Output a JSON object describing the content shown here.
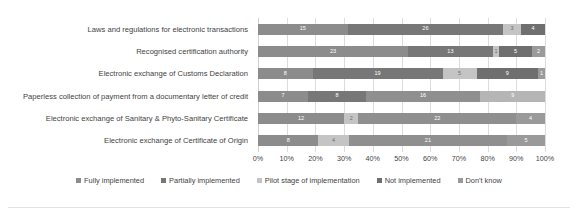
{
  "chart_data": {
    "type": "bar",
    "title": "",
    "subtitle": "",
    "xlabel": "",
    "ylabel": "",
    "orientation": "horizontal",
    "stacked": true,
    "normalized_percent": true,
    "grid": true,
    "legend_position": "bottom",
    "xlim": [
      0,
      100
    ],
    "xticks": [
      "0%",
      "10%",
      "20%",
      "30%",
      "40%",
      "50%",
      "60%",
      "70%",
      "80%",
      "90%",
      "100%"
    ],
    "categories": [
      "Laws and regulations for electronic transactions",
      "Recognised certification authority",
      "Electronic exchange of Customs Declaration",
      "Paperless collection of payment from a documentary letter of credit",
      "Electronic exchange of Sanitary & Phyto-Sanitary Certificate",
      "Electronic exchange of Certificate of Origin"
    ],
    "series": [
      {
        "name": "Fully implemented",
        "color": "#8c8c8c",
        "values": [
          15,
          23,
          8,
          7,
          12,
          8
        ]
      },
      {
        "name": "Partially implemented",
        "color": "#777777",
        "values": [
          26,
          13,
          19,
          8,
          2,
          4
        ]
      },
      {
        "name": "Pilot stage of implementation",
        "color": "#c4c4c4",
        "values": [
          3,
          1,
          5,
          16,
          22,
          21
        ]
      },
      {
        "name": "Not implemented",
        "color": "#6f6f6f",
        "values": [
          4,
          5,
          9,
          9,
          4,
          5
        ]
      },
      {
        "name": "Don't know",
        "color": "#9a9a9a",
        "values": [
          0,
          2,
          1,
          0,
          0,
          0
        ]
      }
    ],
    "bars": [
      {
        "category": "Laws and regulations for electronic transactions",
        "segments": [
          {
            "series": "Fully implemented",
            "value": 15,
            "label": "15",
            "percent": 31.25,
            "color": "#8c8c8c",
            "label_color": "light"
          },
          {
            "series": "Partially implemented",
            "value": 26,
            "label": "26",
            "percent": 54.17,
            "color": "#777777",
            "label_color": "light"
          },
          {
            "series": "Pilot stage of implementation",
            "value": 3,
            "label": "3",
            "percent": 6.25,
            "color": "#c4c4c4",
            "label_color": "dark"
          },
          {
            "series": "Not implemented",
            "value": 4,
            "label": "4",
            "percent": 8.33,
            "color": "#6f6f6f",
            "label_color": "light"
          },
          {
            "series": "Don't know",
            "value": 0,
            "label": "0",
            "percent": 0.0,
            "color": "#9a9a9a",
            "label_color": "light"
          }
        ]
      },
      {
        "category": "Recognised certification authority",
        "segments": [
          {
            "series": "Fully implemented",
            "value": 23,
            "label": "23",
            "percent": 52.27,
            "color": "#8c8c8c",
            "label_color": "light"
          },
          {
            "series": "Partially implemented",
            "value": 13,
            "label": "13",
            "percent": 29.55,
            "color": "#777777",
            "label_color": "light"
          },
          {
            "series": "Pilot stage of implementation",
            "value": 1,
            "label": "1",
            "percent": 2.27,
            "color": "#c4c4c4",
            "label_color": "dark"
          },
          {
            "series": "Not implemented",
            "value": 5,
            "label": "5",
            "percent": 11.36,
            "color": "#6f6f6f",
            "label_color": "light"
          },
          {
            "series": "Don't know",
            "value": 2,
            "label": "2",
            "percent": 4.55,
            "color": "#9a9a9a",
            "label_color": "light"
          }
        ]
      },
      {
        "category": "Electronic exchange of Customs Declaration",
        "segments": [
          {
            "series": "Fully implemented",
            "value": 8,
            "label": "8",
            "percent": 19.05,
            "color": "#8c8c8c",
            "label_color": "light"
          },
          {
            "series": "Partially implemented",
            "value": 19,
            "label": "19",
            "percent": 45.24,
            "color": "#777777",
            "label_color": "light"
          },
          {
            "series": "Pilot stage of implementation",
            "value": 5,
            "label": "5",
            "percent": 11.9,
            "color": "#c4c4c4",
            "label_color": "dark"
          },
          {
            "series": "Not implemented",
            "value": 9,
            "label": "9",
            "percent": 21.43,
            "color": "#6f6f6f",
            "label_color": "light"
          },
          {
            "series": "Don't know",
            "value": 1,
            "label": "1",
            "percent": 2.38,
            "color": "#9a9a9a",
            "label_color": "light"
          }
        ]
      },
      {
        "category": "Paperless collection of payment from a documentary letter of credit",
        "segments": [
          {
            "series": "Fully implemented",
            "value": 7,
            "label": "7",
            "percent": 17.5,
            "color": "#8c8c8c",
            "label_color": "light"
          },
          {
            "series": "Partially implemented",
            "value": 8,
            "label": "8",
            "percent": 20.0,
            "color": "#777777",
            "label_color": "light"
          },
          {
            "series": "Pilot stage of implementation",
            "value": 16,
            "label": "16",
            "percent": 40.0,
            "color": "#8f8f8f",
            "label_color": "light"
          },
          {
            "series": "Not implemented",
            "value": 9,
            "label": "9",
            "percent": 22.5,
            "color": "#b5b5b5",
            "label_color": "light"
          },
          {
            "series": "Don't know",
            "value": 0,
            "label": "",
            "percent": 0.0,
            "color": "#9a9a9a",
            "label_color": "light"
          }
        ]
      },
      {
        "category": "Electronic exchange of Sanitary & Phyto-Sanitary Certificate",
        "segments": [
          {
            "series": "Fully implemented",
            "value": 12,
            "label": "12",
            "percent": 30.0,
            "color": "#8c8c8c",
            "label_color": "light"
          },
          {
            "series": "Partially implemented",
            "value": 2,
            "label": "2",
            "percent": 5.0,
            "color": "#c4c4c4",
            "label_color": "dark"
          },
          {
            "series": "Pilot stage of implementation",
            "value": 22,
            "label": "22",
            "percent": 55.0,
            "color": "#8f8f8f",
            "label_color": "light"
          },
          {
            "series": "Not implemented",
            "value": 4,
            "label": "4",
            "percent": 10.0,
            "color": "#9a9a9a",
            "label_color": "light"
          },
          {
            "series": "Don't know",
            "value": 0,
            "label": "",
            "percent": 0.0,
            "color": "#9a9a9a",
            "label_color": "light"
          }
        ]
      },
      {
        "category": "Electronic exchange of Certificate of Origin",
        "segments": [
          {
            "series": "Fully implemented",
            "value": 8,
            "label": "8",
            "percent": 21.05,
            "color": "#8c8c8c",
            "label_color": "light"
          },
          {
            "series": "Partially implemented",
            "value": 4,
            "label": "4",
            "percent": 10.53,
            "color": "#c4c4c4",
            "label_color": "dark"
          },
          {
            "series": "Pilot stage of implementation",
            "value": 21,
            "label": "21",
            "percent": 55.26,
            "color": "#8f8f8f",
            "label_color": "light"
          },
          {
            "series": "Not implemented",
            "value": 5,
            "label": "5",
            "percent": 13.16,
            "color": "#9a9a9a",
            "label_color": "light"
          },
          {
            "series": "Don't know",
            "value": 0,
            "label": "",
            "percent": 0.0,
            "color": "#9a9a9a",
            "label_color": "light"
          }
        ]
      }
    ],
    "legend": [
      {
        "label": "Fully implemented",
        "color": "#8c8c8c"
      },
      {
        "label": "Partially implemented",
        "color": "#777777"
      },
      {
        "label": "Pilot stage of implementation",
        "color": "#c4c4c4"
      },
      {
        "label": "Not implemented",
        "color": "#6f6f6f"
      },
      {
        "label": "Don't know",
        "color": "#9a9a9a"
      }
    ]
  }
}
